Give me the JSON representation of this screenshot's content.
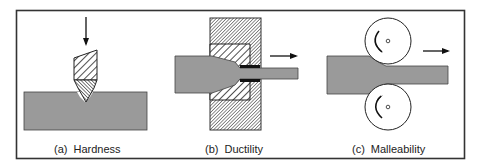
{
  "figure": {
    "panels": [
      {
        "id": "a",
        "label": "(a)",
        "title": "Hardness"
      },
      {
        "id": "b",
        "label": "(b)",
        "title": "Ductility"
      },
      {
        "id": "c",
        "label": "(c)",
        "title": "Malleability"
      }
    ],
    "colors": {
      "material": "#9a9a9a",
      "border": "#333333",
      "background": "#ffffff",
      "die": "#8a8a8a"
    }
  }
}
